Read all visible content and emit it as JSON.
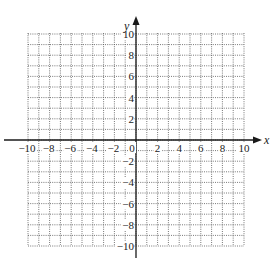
{
  "graph": {
    "type": "coordinate-plane",
    "x_axis": {
      "label": "x",
      "min": -10,
      "max": 10,
      "grid_step": 1,
      "label_step": 2,
      "tick_labels": [
        "−10",
        "−8",
        "−6",
        "−4",
        "−2",
        "0",
        "2",
        "4",
        "6",
        "8",
        "10"
      ]
    },
    "y_axis": {
      "label": "y",
      "min": -10,
      "max": 10,
      "grid_step": 1,
      "label_step": 2,
      "tick_labels": [
        "10",
        "8",
        "6",
        "4",
        "2",
        "−2",
        "−4",
        "−6",
        "−8",
        "−10"
      ]
    },
    "grid_style": "dotted",
    "colors": {
      "grid": "#555555",
      "axis": "#1a1a1a",
      "text": "#222222",
      "background": "#ffffff"
    }
  }
}
